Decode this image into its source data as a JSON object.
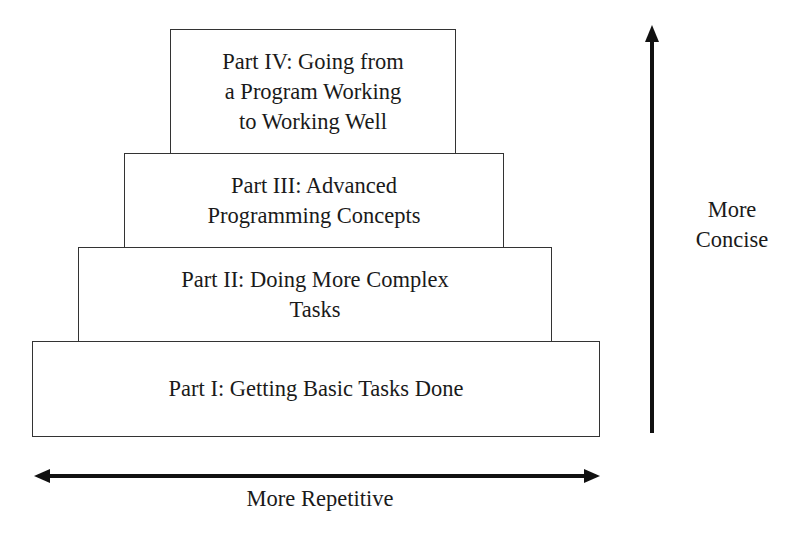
{
  "diagram": {
    "type": "stepped pyramid",
    "levels": [
      {
        "id": "part-iv",
        "text": "Part IV: Going from\na Program Working\nto Working Well"
      },
      {
        "id": "part-iii",
        "text": "Part III: Advanced\nProgramming Concepts"
      },
      {
        "id": "part-ii",
        "text": "Part II: Doing More Complex\nTasks"
      },
      {
        "id": "part-i",
        "text": "Part I: Getting Basic Tasks Done"
      }
    ],
    "vertical_axis": {
      "label": "More\nConcise",
      "direction": "up"
    },
    "horizontal_axis": {
      "label": "More Repetitive",
      "direction": "both"
    },
    "colors": {
      "line": "#333333",
      "text": "#1a1a1a",
      "background": "#ffffff"
    }
  }
}
